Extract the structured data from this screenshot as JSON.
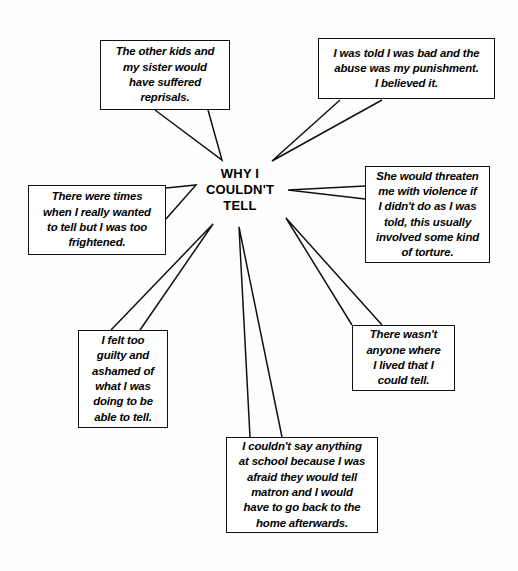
{
  "diagram": {
    "type": "spider-map",
    "center": {
      "label": "WHY I\nCOULDN'T\nTELL"
    },
    "nodes": [
      {
        "id": "reprisals",
        "name": "node-reprisals",
        "text": "The other kids and\nmy sister would\nhave suffered\nreprisals.",
        "x": 100,
        "y": 40,
        "w": 130,
        "h": 70
      },
      {
        "id": "punishment",
        "name": "node-punishment",
        "text": "I was told I was bad and the\nabuse was my punishment.\nI believed it.",
        "x": 318,
        "y": 38,
        "w": 177,
        "h": 61
      },
      {
        "id": "threaten",
        "name": "node-threaten",
        "text": "She would threaten\nme with violence if\nI didn't do as I was\ntold, this usually\ninvolved some kind\nof torture.",
        "x": 365,
        "y": 166,
        "w": 125,
        "h": 97
      },
      {
        "id": "frightened",
        "name": "node-frightened",
        "text": "There were times\nwhen I really wanted\nto tell but I was too\nfrightened.",
        "x": 28,
        "y": 185,
        "w": 138,
        "h": 70
      },
      {
        "id": "guilty",
        "name": "node-guilty",
        "text": "I felt too\nguilty and\nashamed of\nwhat I was\ndoing to be\nable to tell.",
        "x": 78,
        "y": 330,
        "w": 90,
        "h": 98
      },
      {
        "id": "no-one",
        "name": "node-no-one",
        "text": "There wasn't\nanyone where\nI lived that I\ncould tell.",
        "x": 352,
        "y": 325,
        "w": 103,
        "h": 66
      },
      {
        "id": "school",
        "name": "node-school",
        "text": "I couldn't say anything\nat school because I was\nafraid they would tell\nmatron and I would\nhave to go back to the\nhome afterwards.",
        "x": 226,
        "y": 437,
        "w": 152,
        "h": 96
      }
    ],
    "edges": [
      {
        "name": "edge-reprisals",
        "from": "reprisals",
        "a": [
          155,
          110
        ],
        "b": [
          208,
          110
        ],
        "tip": [
          222,
          160
        ]
      },
      {
        "name": "edge-punishment",
        "from": "punishment",
        "a": [
          340,
          100
        ],
        "b": [
          382,
          100
        ],
        "tip": [
          272,
          161
        ]
      },
      {
        "name": "edge-threaten",
        "from": "threaten",
        "a": [
          365,
          186
        ],
        "b": [
          365,
          199
        ],
        "tip": [
          288,
          190
        ]
      },
      {
        "name": "edge-frightened",
        "from": "frightened",
        "a": [
          166,
          188
        ],
        "b": [
          166,
          219
        ],
        "tip": [
          196,
          185
        ]
      },
      {
        "name": "edge-guilty",
        "from": "guilty",
        "a": [
          111,
          330
        ],
        "b": [
          140,
          330
        ],
        "tip": [
          213,
          224
        ]
      },
      {
        "name": "edge-no-one",
        "from": "no-one",
        "a": [
          352,
          325
        ],
        "b": [
          382,
          325
        ],
        "tip": [
          286,
          218
        ]
      },
      {
        "name": "edge-school",
        "from": "school",
        "a": [
          250,
          437
        ],
        "b": [
          282,
          437
        ],
        "tip": [
          239,
          227
        ]
      }
    ],
    "colors": {
      "ink": "#111111",
      "paper": "#fefefe"
    }
  }
}
